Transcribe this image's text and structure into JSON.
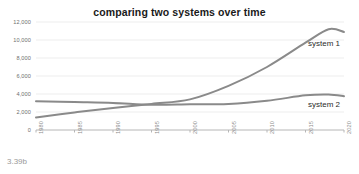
{
  "figure": {
    "caption": "3.39b"
  },
  "chart_data": {
    "type": "line",
    "title": "comparing two systems over time",
    "xlabel": "",
    "ylabel": "",
    "xlim": [
      1980,
      2020
    ],
    "ylim": [
      0,
      12000
    ],
    "grid": true,
    "grid_axis": "y",
    "legend_position": "inline-right",
    "yticks": [
      0,
      2000,
      4000,
      6000,
      8000,
      10000,
      12000
    ],
    "ytick_labels": [
      "0",
      "2,000",
      "4,000",
      "6,000",
      "8,000",
      "10,000",
      "12,000"
    ],
    "xticks": [
      1980,
      1985,
      1990,
      1995,
      2000,
      2005,
      2010,
      2015,
      2020
    ],
    "xtick_labels": [
      "1980",
      "1985",
      "1990",
      "1995",
      "2000",
      "2005",
      "2010",
      "2015",
      "2020"
    ],
    "xtick_rotation": 90,
    "x": [
      1980,
      1985,
      1990,
      1995,
      2000,
      2005,
      2010,
      2015,
      2018,
      2020
    ],
    "series": [
      {
        "name": "system 1",
        "color": "#8a8a8a",
        "label_text": "system 1",
        "values": [
          1400,
          1950,
          2450,
          2900,
          3400,
          4900,
          7000,
          9700,
          11200,
          10900
        ]
      },
      {
        "name": "system 2",
        "color": "#8a8a8a",
        "label_text": "system 2",
        "values": [
          3200,
          3100,
          3000,
          2800,
          2850,
          2900,
          3250,
          3850,
          3950,
          3750
        ]
      }
    ]
  }
}
